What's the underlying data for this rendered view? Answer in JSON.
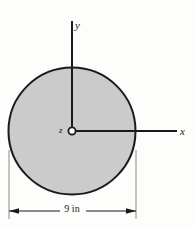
{
  "figure": {
    "kind": "engineering-cross-section-diagram",
    "background_color": "#fdfdfc",
    "shape": {
      "name": "circular-cross-section",
      "type": "circle",
      "fill_color": "#cbcbcb",
      "stroke_color": "#1a1a1a",
      "stroke_width": 2,
      "center_x": 72,
      "center_y": 131,
      "radius": 63.5
    },
    "axes": {
      "color": "#1a1a1a",
      "line_width": 2,
      "origin_x": 72,
      "origin_y": 131,
      "y_axis": {
        "label": "y",
        "x": 72,
        "y_top": 20,
        "y_bottom": 131
      },
      "x_axis": {
        "label": "x",
        "y": 131,
        "x_left": 72,
        "x_right": 177
      },
      "z_axis": {
        "label": "z",
        "marker": "out-of-page-circle",
        "marker_radius": 3.6,
        "marker_cx": 72,
        "marker_cy": 131
      }
    },
    "dimension": {
      "label": "9 in",
      "value": 9,
      "unit": "in",
      "line_y": 211,
      "x_start": 9,
      "x_end": 136,
      "extension_color": "#8a8a8a",
      "line_color": "#1a1a1a",
      "extension_top": 150,
      "extension_bottom": 219
    }
  }
}
